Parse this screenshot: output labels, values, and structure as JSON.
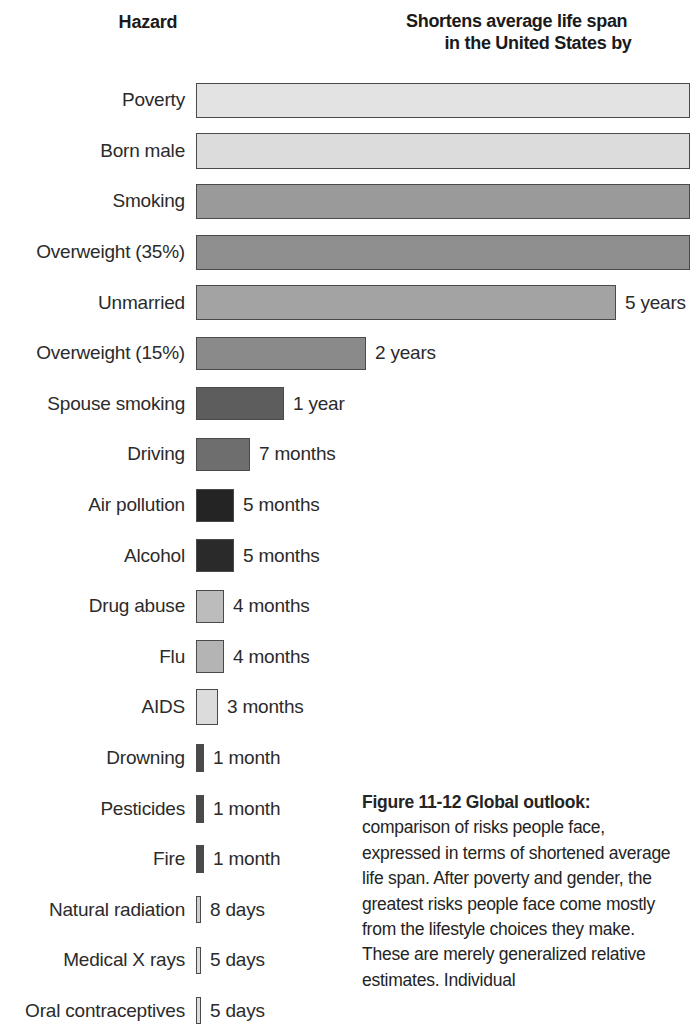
{
  "headers": {
    "hazard": "Hazard",
    "value_line1": "Shortens average life span",
    "value_line2": "in the United States by"
  },
  "caption": {
    "title": "Figure 11-12  Global outlook:",
    "body": " comparison of risks people face, expressed in terms of shortened average life span. After poverty and gender, the greatest risks people face come mostly from the lifestyle choices they make. These are merely generalized relative estimates. Individual"
  },
  "chart_data": {
    "type": "bar",
    "title": "Shortens average life span in the United States by",
    "xlabel": "Shortens average life span in the United States by",
    "ylabel": "Hazard",
    "grid": false,
    "legend": "none",
    "orientation": "horizontal",
    "units": "shortened life span",
    "categories": [
      "Poverty",
      "Born male",
      "Smoking",
      "Overweight (35%)",
      "Unmarried",
      "Overweight (15%)",
      "Spouse smoking",
      "Driving",
      "Air pollution",
      "Alcohol",
      "Drug abuse",
      "Flu",
      "AIDS",
      "Drowning",
      "Pesticides",
      "Fire",
      "Natural radiation",
      "Medical X rays",
      "Oral contraceptives"
    ],
    "value_labels": [
      "",
      "",
      "",
      "",
      "5 years",
      "2 years",
      "1 year",
      "7 months",
      "5 months",
      "5 months",
      "4 months",
      "4 months",
      "3 months",
      "1 month",
      "1 month",
      "1 month",
      "8 days",
      "5 days",
      "5 days"
    ],
    "values_days": [
      3285,
      2737,
      2372,
      2190,
      1825,
      730,
      365,
      213,
      152,
      152,
      122,
      122,
      91,
      30,
      30,
      30,
      8,
      5,
      5
    ],
    "bar_pixel_widths": [
      480,
      480,
      480,
      480,
      420,
      170,
      88,
      54,
      38,
      38,
      28,
      28,
      22,
      8,
      8,
      8,
      5,
      5,
      5
    ],
    "bar_pixel_heights": [
      35,
      36,
      35,
      35,
      35,
      33,
      33,
      33,
      33,
      33,
      33,
      33,
      36,
      28,
      28,
      28,
      27,
      27,
      27
    ],
    "bar_colors": [
      "#e3e3e3",
      "#dcdcdc",
      "#9a9a9a",
      "#8f8f8f",
      "#a3a3a3",
      "#8a8a8a",
      "#5d5d5d",
      "#6e6e6e",
      "#242424",
      "#2a2a2a",
      "#bcbcbc",
      "#b4b4b4",
      "#dcdcdc",
      "#4a4a4a",
      "#4a4a4a",
      "#4a4a4a",
      "#cfcfcf",
      "#dedede",
      "#dedede"
    ],
    "bar_clipped_right": [
      true,
      true,
      true,
      true,
      false,
      false,
      false,
      false,
      false,
      false,
      false,
      false,
      false,
      false,
      false,
      false,
      false,
      false,
      false
    ]
  }
}
